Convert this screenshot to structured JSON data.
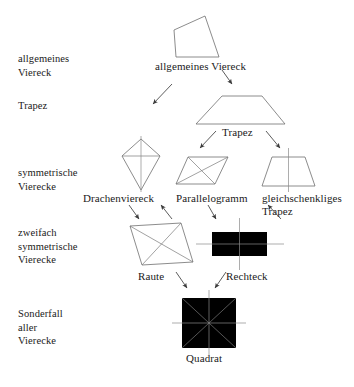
{
  "diagram": {
    "language": "de",
    "categories": [
      {
        "id": "level-1",
        "label": "allgemeines\nViereck",
        "x": 18,
        "y": 52
      },
      {
        "id": "level-2",
        "label": "Trapez",
        "x": 18,
        "y": 99
      },
      {
        "id": "level-3",
        "label": "symmetrische\nVierecke",
        "x": 18,
        "y": 166
      },
      {
        "id": "level-4",
        "label": "zweifach\nsymmetrische\nVierecke",
        "x": 18,
        "y": 226
      },
      {
        "id": "level-5",
        "label": "Sonderfall\naller\nVierecke",
        "x": 18,
        "y": 307
      }
    ],
    "shapes": [
      {
        "id": "allgemeines-viereck",
        "label": "allgemeines Viereck",
        "label_x": 155,
        "label_y": 60
      },
      {
        "id": "trapez",
        "label": "Trapez",
        "label_x": 222,
        "label_y": 126
      },
      {
        "id": "drachenviereck",
        "label": "Drachenviereck",
        "label_x": 83,
        "label_y": 192
      },
      {
        "id": "parallelogramm",
        "label": "Parallelogramm",
        "label_x": 176,
        "label_y": 192
      },
      {
        "id": "gleichschenkliges-trapez",
        "label": "gleichschenkliges\n          Trapez",
        "label_x": 262,
        "label_y": 192
      },
      {
        "id": "raute",
        "label": "Raute",
        "label_x": 138,
        "label_y": 270
      },
      {
        "id": "rechteck",
        "label": "Rechteck",
        "label_x": 226,
        "label_y": 270
      },
      {
        "id": "quadrat",
        "label": "Quadrat",
        "label_x": 186,
        "label_y": 352
      }
    ],
    "colors": {
      "background": "#ffffff",
      "stroke": "#6f6f6f",
      "axis": "#8a8a8a",
      "arrow": "#3a3a3a",
      "text": "#1a1a1a"
    },
    "edges": [
      {
        "from": "allgemeines-viereck",
        "to": "trapez"
      },
      {
        "from": "allgemeines-viereck",
        "to": "drachenviereck"
      },
      {
        "from": "trapez",
        "to": "parallelogramm"
      },
      {
        "from": "trapez",
        "to": "gleichschenkliges-trapez"
      },
      {
        "from": "drachenviereck",
        "to": "raute"
      },
      {
        "from": "parallelogramm",
        "to": "raute"
      },
      {
        "from": "parallelogramm",
        "to": "rechteck"
      },
      {
        "from": "gleichschenkliges-trapez",
        "to": "rechteck"
      },
      {
        "from": "raute",
        "to": "quadrat"
      },
      {
        "from": "rechteck",
        "to": "quadrat"
      }
    ]
  }
}
